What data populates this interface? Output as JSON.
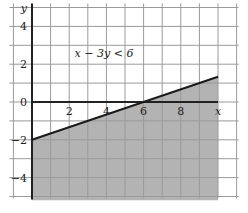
{
  "chart_data": {
    "type": "line",
    "title": "",
    "annotation": "x − 3y < 6",
    "xlabel": "x",
    "ylabel": "y",
    "xlim": [
      -1,
      11
    ],
    "ylim": [
      -5,
      5
    ],
    "grid": true,
    "x_ticks": [
      2,
      4,
      6,
      8
    ],
    "x_tick_labels": [
      "2",
      "4",
      "6",
      "8"
    ],
    "y_ticks": [
      4,
      2,
      0,
      -2,
      -4
    ],
    "y_tick_labels": [
      "4",
      "2",
      "0",
      "−2",
      "−4"
    ],
    "series": [
      {
        "name": "boundary line x − 3y = 6",
        "x": [
          0,
          10
        ],
        "y": [
          -2,
          1.333
        ]
      }
    ],
    "shaded_region": {
      "description": "region below the line x − 3y = 6 (x − 3y < 6 shown shaded here), for 0 ≤ x ≤ 10, down to y = -5",
      "polygon": [
        [
          0,
          -2
        ],
        [
          10,
          1.333
        ],
        [
          10,
          -5.2
        ],
        [
          0,
          -5.2
        ]
      ],
      "color": "#b3b3b3"
    },
    "colors": {
      "grid": "#9a9a9a",
      "axis": "#222222",
      "line": "#1a1a1a",
      "shade": "#b3b3b3"
    }
  }
}
